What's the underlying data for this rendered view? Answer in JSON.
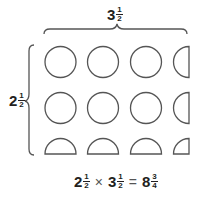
{
  "diagram": {
    "top_label": {
      "whole": "3",
      "numerator": "1",
      "denominator": "2"
    },
    "left_label": {
      "whole": "2",
      "numerator": "1",
      "denominator": "2"
    },
    "grid": {
      "rows": [
        [
          "full",
          "full",
          "full",
          "left-half"
        ],
        [
          "full",
          "full",
          "full",
          "left-half"
        ],
        [
          "top-half",
          "top-half",
          "top-half",
          "quarter"
        ]
      ]
    },
    "equation": {
      "factor1": {
        "whole": "2",
        "numerator": "1",
        "denominator": "2"
      },
      "operator": "×",
      "factor2": {
        "whole": "3",
        "numerator": "1",
        "denominator": "2"
      },
      "equals": "=",
      "result": {
        "whole": "8",
        "numerator": "3",
        "denominator": "4"
      }
    },
    "colors": {
      "stroke": "#555555",
      "text": "#231f20"
    }
  }
}
